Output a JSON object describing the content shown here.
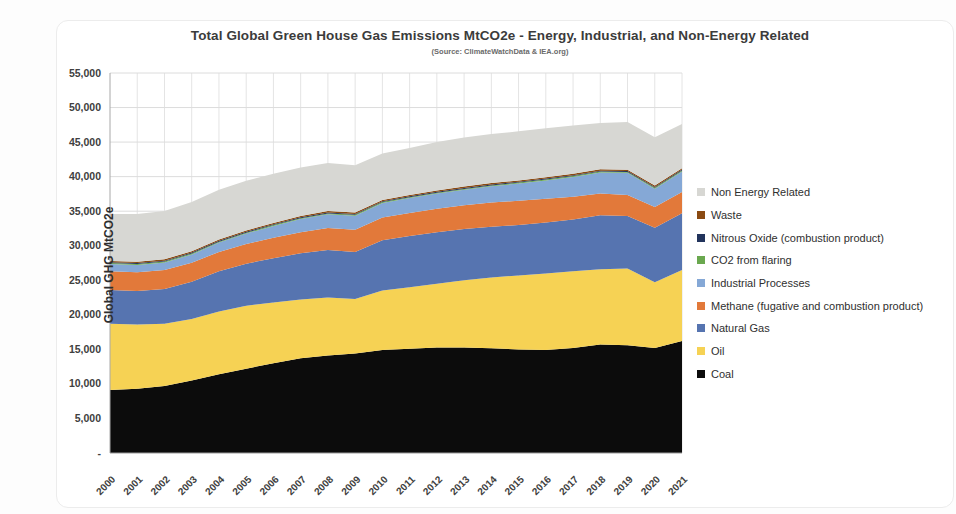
{
  "figure": {
    "title": "Total Global Green House Gas Emissions MtCO2e - Energy, Industrial, and Non-Energy Related",
    "subtitle": "(Source: ClimateWatchData & IEA.org)"
  },
  "chart_data": {
    "type": "area",
    "stacked": true,
    "title": "Total Global Green House Gas Emissions MtCO2e - Energy, Industrial, and Non-Energy Related",
    "subtitle": "(Source: ClimateWatchData & IEA.org)",
    "xlabel": "",
    "ylabel": "Global GHG MtCO2e",
    "x_tick_labels": [
      "2000",
      "2001",
      "2002",
      "2003",
      "2004",
      "2005",
      "2006",
      "2007",
      "2008",
      "2009",
      "2010",
      "2011",
      "2012",
      "2013",
      "2014",
      "2015",
      "2016",
      "2017",
      "2018",
      "2019",
      "2020",
      "2021"
    ],
    "ylim": [
      0,
      55000
    ],
    "y_tick_step": 5000,
    "y_tick_labels": [
      "-",
      "5,000",
      "10,000",
      "15,000",
      "20,000",
      "25,000",
      "30,000",
      "35,000",
      "40,000",
      "45,000",
      "50,000",
      "55,000"
    ],
    "grid": true,
    "legend_position": "right",
    "legend_order_top_to_bottom": [
      "Non Energy Related",
      "Waste",
      "Nitrous Oxide (combustion product)",
      "CO2 from flaring",
      "Industrial Processes",
      "Methane (fugative and combustion product)",
      "Natural Gas",
      "Oil",
      "Coal"
    ],
    "series": [
      {
        "name": "Coal",
        "color": "#0c0c0c",
        "values": [
          9100,
          9300,
          9700,
          10500,
          11400,
          12200,
          13000,
          13700,
          14100,
          14400,
          14900,
          15100,
          15250,
          15250,
          15150,
          15000,
          14900,
          15200,
          15700,
          15600,
          15200,
          16200
        ]
      },
      {
        "name": "Oil",
        "color": "#f6d254",
        "values": [
          9600,
          9300,
          9000,
          8900,
          9100,
          9100,
          8800,
          8500,
          8400,
          7900,
          8600,
          8900,
          9250,
          9750,
          10250,
          10700,
          11100,
          11100,
          10900,
          11100,
          9500,
          10300
        ]
      },
      {
        "name": "Natural Gas",
        "color": "#5674b0",
        "values": [
          4900,
          4850,
          5050,
          5400,
          5800,
          6100,
          6400,
          6700,
          6900,
          6800,
          7300,
          7400,
          7450,
          7400,
          7350,
          7300,
          7350,
          7500,
          7800,
          7600,
          7900,
          8200
        ]
      },
      {
        "name": "Methane (fugative and combustion product)",
        "color": "#e2793a",
        "values": [
          2700,
          2700,
          2720,
          2750,
          2800,
          2850,
          2950,
          3050,
          3150,
          3200,
          3280,
          3350,
          3400,
          3450,
          3500,
          3500,
          3450,
          3300,
          3150,
          3050,
          3000,
          3060
        ]
      },
      {
        "name": "Industrial Processes",
        "color": "#85a8d6",
        "values": [
          1050,
          1070,
          1100,
          1200,
          1350,
          1500,
          1700,
          1900,
          2000,
          2050,
          2100,
          2150,
          2200,
          2250,
          2350,
          2500,
          2650,
          2850,
          3050,
          3200,
          2650,
          3000
        ]
      },
      {
        "name": "CO2 from flaring",
        "color": "#6aa84f",
        "values": [
          130,
          130,
          130,
          130,
          130,
          130,
          130,
          130,
          130,
          130,
          130,
          130,
          130,
          130,
          130,
          130,
          130,
          130,
          130,
          130,
          130,
          130
        ]
      },
      {
        "name": "Nitrous Oxide (combustion product)",
        "color": "#22345c",
        "values": [
          130,
          130,
          130,
          130,
          130,
          130,
          130,
          130,
          130,
          130,
          130,
          130,
          130,
          130,
          130,
          130,
          130,
          130,
          130,
          130,
          130,
          130
        ]
      },
      {
        "name": "Waste",
        "color": "#8a4a12",
        "values": [
          200,
          200,
          200,
          200,
          200,
          200,
          200,
          200,
          200,
          200,
          200,
          200,
          200,
          200,
          200,
          200,
          200,
          200,
          200,
          200,
          200,
          200
        ]
      },
      {
        "name": "Non Energy Related",
        "color": "#d7d7d3",
        "values": [
          6800,
          6900,
          7000,
          7100,
          7200,
          7200,
          7100,
          7000,
          6950,
          6850,
          6700,
          6800,
          7000,
          7100,
          7100,
          7100,
          7100,
          7000,
          6700,
          6900,
          7000,
          6400
        ]
      }
    ]
  }
}
